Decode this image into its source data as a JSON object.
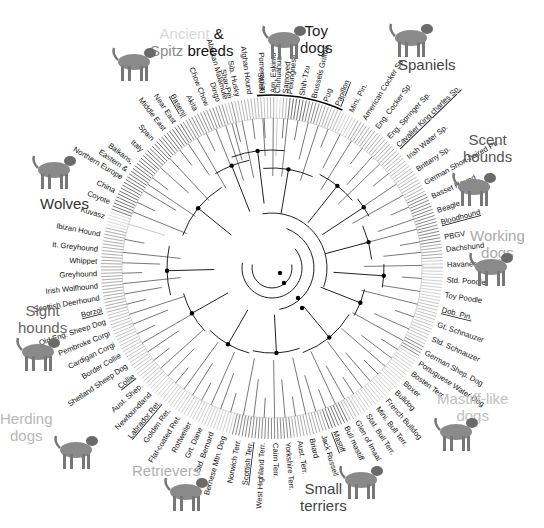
{
  "figure": {
    "type": "circular-phylogenetic-tree",
    "center": [
      272,
      268
    ],
    "leaf_radius": 172,
    "ring_inner": 150,
    "ring_outer": 171
  },
  "groups": [
    {
      "id": "ancient-spitz",
      "parts": [
        {
          "text": "Ancient",
          "color": "#d8d8d8"
        },
        {
          "text": " & ",
          "color": "#111111"
        }
      ],
      "line2": [
        {
          "text": "Spitz",
          "color": "#8a8a8a"
        },
        {
          "text": " breeds",
          "color": "#111111"
        }
      ],
      "x": 150,
      "y": 25,
      "dog": "basenji",
      "dog_x": 108,
      "dog_y": 40
    },
    {
      "id": "toy-dogs",
      "parts": [
        {
          "text": "Toy",
          "color": "#222222"
        }
      ],
      "line2": [
        {
          "text": "dogs",
          "color": "#222222"
        }
      ],
      "x": 300,
      "y": 22,
      "dog": "papillon",
      "dog_x": 258,
      "dog_y": 18
    },
    {
      "id": "spaniels",
      "parts": [
        {
          "text": "Spaniels",
          "color": "#444444"
        }
      ],
      "line2": [],
      "x": 398,
      "y": 56,
      "dog": "springer",
      "dog_x": 385,
      "dog_y": 16
    },
    {
      "id": "scent-hounds",
      "parts": [
        {
          "text": "Scent",
          "color": "#555555"
        }
      ],
      "line2": [
        {
          "text": "hounds",
          "color": "#555555"
        }
      ],
      "x": 463,
      "y": 131,
      "dog": "bloodhound",
      "dog_x": 448,
      "dog_y": 165
    },
    {
      "id": "working-dogs",
      "parts": [
        {
          "text": "Working",
          "color": "#aaaaaa"
        }
      ],
      "line2": [
        {
          "text": "dogs",
          "color": "#aaaaaa"
        }
      ],
      "x": 470,
      "y": 227,
      "dog": "doberman",
      "dog_x": 465,
      "dog_y": 245
    },
    {
      "id": "mastiff-like",
      "parts": [
        {
          "text": "Mastiff-like",
          "color": "#c0c0c0"
        }
      ],
      "line2": [
        {
          "text": "dogs",
          "color": "#c0c0c0"
        }
      ],
      "x": 437,
      "y": 390,
      "dog": "mastiff",
      "dog_x": 430,
      "dog_y": 410
    },
    {
      "id": "small-terriers",
      "parts": [
        {
          "text": "Small",
          "color": "#444444"
        }
      ],
      "line2": [
        {
          "text": "terriers",
          "color": "#444444"
        }
      ],
      "x": 300,
      "y": 480,
      "dog": "scottie",
      "dog_x": 335,
      "dog_y": 458
    },
    {
      "id": "retrievers",
      "parts": [
        {
          "text": "Retrievers",
          "color": "#b0b0b0"
        }
      ],
      "line2": [],
      "x": 132,
      "y": 462,
      "dog": "labrador",
      "dog_x": 160,
      "dog_y": 470
    },
    {
      "id": "herding-dogs",
      "parts": [
        {
          "text": "Herding",
          "color": "#b8b8b8"
        }
      ],
      "line2": [
        {
          "text": "dogs",
          "color": "#b8b8b8"
        }
      ],
      "x": 0,
      "y": 410,
      "dog": "collie",
      "dog_x": 50,
      "dog_y": 428
    },
    {
      "id": "sight-hounds",
      "parts": [
        {
          "text": "Sight",
          "color": "#666666"
        }
      ],
      "line2": [
        {
          "text": "hounds",
          "color": "#666666"
        }
      ],
      "x": 18,
      "y": 302,
      "dog": "borzoi",
      "dog_x": 12,
      "dog_y": 330
    },
    {
      "id": "wolves",
      "parts": [
        {
          "text": "Wolves",
          "color": "#333333"
        }
      ],
      "line2": [],
      "x": 40,
      "y": 195,
      "dog": "wolf",
      "dog_x": 28,
      "dog_y": 148
    }
  ],
  "leaves": [
    {
      "name": "Pomeranian",
      "angle": -93,
      "shade": "#aaaaaa"
    },
    {
      "name": "Chihuahua",
      "angle": -88,
      "shade": "#cccccc"
    },
    {
      "name": "Pekingnese",
      "angle": -84,
      "shade": "#333333"
    },
    {
      "name": "Shih-Tzu",
      "angle": -80,
      "shade": "#333333"
    },
    {
      "name": "Brussels Griffon",
      "angle": -76,
      "shade": "#555555"
    },
    {
      "name": "Pug",
      "angle": -72,
      "shade": "#888888"
    },
    {
      "name": "Papillon",
      "angle": -68,
      "shade": "#999999",
      "underline": true
    },
    {
      "name": "Mini. Pin.",
      "angle": -63,
      "shade": "#bbbbbb"
    },
    {
      "name": "American Cocker Sp.",
      "angle": -58,
      "shade": "#888888"
    },
    {
      "name": "Eng. Cocker Sp.",
      "angle": -53,
      "shade": "#888888"
    },
    {
      "name": "Eng. Springer Sp.",
      "angle": -48,
      "shade": "#888888"
    },
    {
      "name": "Cavalier King charles Sp.",
      "angle": -44,
      "shade": "#888888",
      "underline": true
    },
    {
      "name": "Irish Water Sp.",
      "angle": -39,
      "shade": "#999999"
    },
    {
      "name": "Brittany Sp.",
      "angle": -34,
      "shade": "#999999"
    },
    {
      "name": "German Short-haired Ptr.",
      "angle": -29,
      "shade": "#999999"
    },
    {
      "name": "Basset Hound",
      "angle": -24,
      "shade": "#555555"
    },
    {
      "name": "Beagle",
      "angle": -19,
      "shade": "#555555"
    },
    {
      "name": "Bloodhound",
      "angle": -15,
      "shade": "#555555",
      "underline": true
    },
    {
      "name": "PBGV",
      "angle": -10,
      "shade": "#555555"
    },
    {
      "name": "Dachshund",
      "angle": -6,
      "shade": "#888888"
    },
    {
      "name": "Havanese",
      "angle": -1,
      "shade": "#bbbbbb"
    },
    {
      "name": "Std. Poodle",
      "angle": 4,
      "shade": "#bbbbbb"
    },
    {
      "name": "Toy Poodle",
      "angle": 9,
      "shade": "#bbbbbb"
    },
    {
      "name": "Dob. Pin.",
      "angle": 14,
      "shade": "#aaaaaa",
      "underline": true
    },
    {
      "name": "Gt. Schnauzer",
      "angle": 19,
      "shade": "#aaaaaa"
    },
    {
      "name": "Std. Schnauzer",
      "angle": 24,
      "shade": "#aaaaaa"
    },
    {
      "name": "German Shep. Dog",
      "angle": 29,
      "shade": "#555555"
    },
    {
      "name": "Portuguese Water Dog",
      "angle": 33,
      "shade": "#bbbbbb"
    },
    {
      "name": "Bosten Terr.",
      "angle": 37,
      "shade": "#bbbbbb"
    },
    {
      "name": "Boxer",
      "angle": 41,
      "shade": "#bbbbbb"
    },
    {
      "name": "Bulldog",
      "angle": 45,
      "shade": "#bbbbbb"
    },
    {
      "name": "French Bulldog",
      "angle": 49,
      "shade": "#bbbbbb"
    },
    {
      "name": "Mini. Bull Terr.",
      "angle": 53,
      "shade": "#bbbbbb"
    },
    {
      "name": "Staf. Bull Terr.",
      "angle": 57,
      "shade": "#bbbbbb"
    },
    {
      "name": "Glen of Imaal",
      "angle": 61,
      "shade": "#999999"
    },
    {
      "name": "Bull mastiff",
      "angle": 65,
      "shade": "#333333"
    },
    {
      "name": "Mastiff",
      "angle": 69,
      "shade": "#333333",
      "underline": true
    },
    {
      "name": "Jack Russell",
      "angle": 73,
      "shade": "#888888"
    },
    {
      "name": "Briard",
      "angle": 77,
      "shade": "#888888"
    },
    {
      "name": "Aust. Terr.",
      "angle": 81,
      "shade": "#888888"
    },
    {
      "name": "Yorkshire Terr.",
      "angle": 85,
      "shade": "#555555"
    },
    {
      "name": "Cairn Terr.",
      "angle": 89,
      "shade": "#555555"
    },
    {
      "name": "West Highland Terr.",
      "angle": 93,
      "shade": "#555555"
    },
    {
      "name": "Scottish Terr.",
      "angle": 97,
      "shade": "#555555",
      "underline": true
    },
    {
      "name": "Norwich Terr.",
      "angle": 101,
      "shade": "#555555"
    },
    {
      "name": "Bernese Mtn. Dog",
      "angle": 106,
      "shade": "#bbbbbb"
    },
    {
      "name": "Std. Bernard",
      "angle": 110,
      "shade": "#bbbbbb"
    },
    {
      "name": "Grt. Dane",
      "angle": 114,
      "shade": "#bbbbbb"
    },
    {
      "name": "Rottweiler",
      "angle": 118,
      "shade": "#bbbbbb"
    },
    {
      "name": "Flat-coated Ret.",
      "angle": 122,
      "shade": "#bbbbbb"
    },
    {
      "name": "Golden Ret.",
      "angle": 126,
      "shade": "#bbbbbb"
    },
    {
      "name": "Labrador Ret.",
      "angle": 130,
      "shade": "#bbbbbb",
      "underline": true
    },
    {
      "name": "Newfoundland",
      "angle": 134,
      "shade": "#bbbbbb"
    },
    {
      "name": "Aust. Shep.",
      "angle": 138,
      "shade": "#aaaaaa"
    },
    {
      "name": "Collie",
      "angle": 142,
      "shade": "#aaaaaa",
      "underline": true
    },
    {
      "name": "Shetland Sheep Dog",
      "angle": 146,
      "shade": "#aaaaaa"
    },
    {
      "name": "Border Collie",
      "angle": 150,
      "shade": "#aaaaaa"
    },
    {
      "name": "Cardigan Corgi",
      "angle": 154,
      "shade": "#aaaaaa"
    },
    {
      "name": "Pembroke Corgi",
      "angle": 158,
      "shade": "#aaaaaa"
    },
    {
      "name": "Old Eng. Sheep Dog",
      "angle": 162,
      "shade": "#aaaaaa"
    },
    {
      "name": "Borzoi",
      "angle": 166,
      "shade": "#888888",
      "underline": true
    },
    {
      "name": "Scottish Deerhound",
      "angle": 170,
      "shade": "#888888"
    },
    {
      "name": "Irish Wolfhound",
      "angle": 174,
      "shade": "#888888"
    },
    {
      "name": "Greyhound",
      "angle": 178,
      "shade": "#888888"
    },
    {
      "name": "Whippet",
      "angle": 182,
      "shade": "#888888"
    },
    {
      "name": "It. Greyhound",
      "angle": 186,
      "shade": "#888888"
    },
    {
      "name": "Ibizan Hound",
      "angle": 191,
      "shade": "#888888"
    },
    {
      "name": "Kuvasz",
      "angle": 197,
      "shade": "#cccccc"
    },
    {
      "name": "Coyote",
      "angle": 202,
      "shade": "#333333"
    },
    {
      "name": "China",
      "angle": 206,
      "shade": "#333333"
    },
    {
      "name": "Northern Europe",
      "angle": 211,
      "shade": "#333333"
    },
    {
      "name": "Eastern &",
      "angle": 214,
      "shade": "#333333"
    },
    {
      "name": "Balkans,",
      "angle": 217,
      "shade": "#333333"
    },
    {
      "name": "Italy",
      "angle": 222,
      "shade": "#333333"
    },
    {
      "name": "Spain",
      "angle": 227,
      "shade": "#333333"
    },
    {
      "name": "Middle East",
      "angle": 232,
      "shade": "#333333"
    },
    {
      "name": "Near East",
      "angle": 236,
      "shade": "#333333"
    },
    {
      "name": "Basenji",
      "angle": 240,
      "shade": "#666666",
      "underline": true
    },
    {
      "name": "Akita",
      "angle": 244,
      "shade": "#666666"
    },
    {
      "name": "Chow Chow",
      "angle": 248,
      "shade": "#666666"
    },
    {
      "name": "Dingo",
      "angle": 252,
      "shade": "#666666"
    },
    {
      "name": "Shar-Pei",
      "angle": 256,
      "shade": "#666666"
    },
    {
      "name": "Alaskan Malamute",
      "angle": 250.5,
      "shade": "#999999",
      "skip": true
    },
    {
      "name": "Alaskan Malamute",
      "angle": 254.5,
      "shade": "#999999"
    },
    {
      "name": "Sib. Husky",
      "angle": 258.5,
      "shade": "#999999"
    },
    {
      "name": "Afghan Hound",
      "angle": 262.5,
      "shade": "#999999"
    },
    {
      "name": "Saluki",
      "angle": 266.5,
      "shade": "#999999"
    },
    {
      "name": "Am. Eskimo",
      "angle": 270.5,
      "shade": "#999999"
    },
    {
      "name": "Samoyed",
      "angle": 274.5,
      "shade": "#999999"
    }
  ],
  "toy_arc": {
    "start": -95,
    "end": -66
  }
}
